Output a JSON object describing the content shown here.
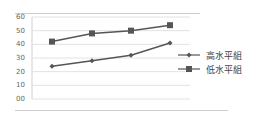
{
  "chart_data": {
    "type": "line",
    "title": "",
    "xlabel": "",
    "ylabel": "",
    "categories": [
      "1",
      "2",
      "3",
      "4"
    ],
    "y_ticks": [
      "60",
      "50",
      "40",
      "30",
      "20",
      "10",
      "00"
    ],
    "ylim": [
      0,
      60
    ],
    "grid": true,
    "legend_position": "right",
    "series": [
      {
        "name": "高水平組",
        "marker": "diamond",
        "values": [
          24,
          28,
          32,
          41
        ],
        "color": "#555555"
      },
      {
        "name": "低水平組",
        "marker": "square",
        "values": [
          42,
          48,
          50,
          54
        ],
        "color": "#555555"
      }
    ]
  }
}
